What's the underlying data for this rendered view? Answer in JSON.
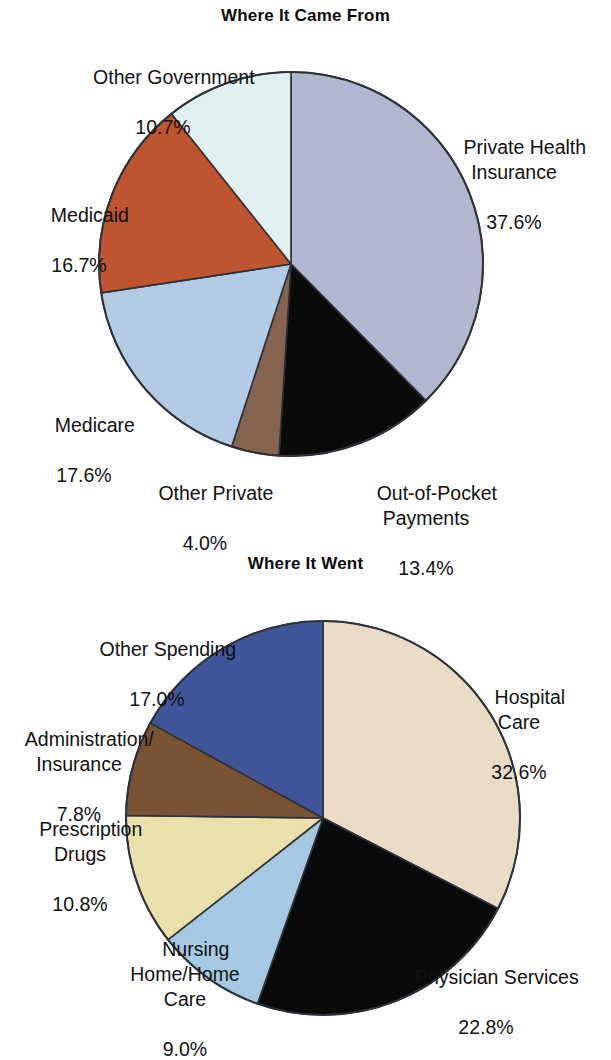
{
  "page": {
    "background": "#ffffff",
    "width": 611,
    "height": 1046
  },
  "charts": [
    {
      "id": "came-from",
      "title": "Where It Came From",
      "center": {
        "x": 291,
        "y": 264
      },
      "radius": 192,
      "start_angle_deg": 0,
      "direction": "clockwise"
    },
    {
      "id": "went",
      "title": "Where It Went",
      "center": {
        "x": 323,
        "y": 278
      },
      "radius": 197,
      "start_angle_deg": 0,
      "direction": "clockwise"
    }
  ],
  "labels": {
    "came_from": {
      "other_government": {
        "name": "Other Government",
        "pct": "10.7%"
      },
      "private_health": {
        "name": "Private Health\nInsurance",
        "pct": "37.6%"
      },
      "medicaid": {
        "name": "Medicaid",
        "pct": "16.7%"
      },
      "medicare": {
        "name": "Medicare",
        "pct": "17.6%"
      },
      "other_private": {
        "name": "Other Private",
        "pct": "4.0%"
      },
      "out_of_pocket": {
        "name": "Out-of-Pocket\nPayments",
        "pct": "13.4%"
      }
    },
    "went": {
      "other_spending": {
        "name": "Other Spending",
        "pct": "17.0%"
      },
      "administration": {
        "name": "Administration/\nInsurance",
        "pct": "7.8%"
      },
      "prescription": {
        "name": "Prescription\nDrugs",
        "pct": "10.8%"
      },
      "nursing_home": {
        "name": "Nursing\nHome/Home\nCare",
        "pct": "9.0%"
      },
      "hospital_care": {
        "name": "Hospital\nCare",
        "pct": "32.6%"
      },
      "physician": {
        "name": "Physician Services",
        "pct": "22.8%"
      }
    }
  },
  "chart_data": [
    {
      "type": "pie",
      "id": "came-from",
      "title": "Where It Came From",
      "xlabel": "",
      "ylabel": "",
      "legend_position": "none",
      "grid": false,
      "units": "percent",
      "total": 100.0,
      "start_angle_deg": 0,
      "direction": "clockwise",
      "categories": [
        "Private Health Insurance",
        "Out-of-Pocket Payments",
        "Other Private",
        "Medicare",
        "Medicaid",
        "Other Government"
      ],
      "values": [
        37.6,
        13.4,
        4.0,
        17.6,
        16.7,
        10.7
      ],
      "slices": [
        {
          "label": "Private Health Insurance",
          "value": 37.6,
          "color": "#b3b6cf",
          "stroke": "#2d3238"
        },
        {
          "label": "Out-of-Pocket Payments",
          "value": 13.4,
          "color": "#0a0a0a",
          "stroke": "#2d3238"
        },
        {
          "label": "Other Private",
          "value": 4.0,
          "color": "#87644f",
          "stroke": "#2d3238"
        },
        {
          "label": "Medicare",
          "value": 17.6,
          "color": "#b2cae4",
          "stroke": "#2d3238"
        },
        {
          "label": "Medicaid",
          "value": 16.7,
          "color": "#bf5430",
          "stroke": "#2d3238"
        },
        {
          "label": "Other Government",
          "value": 10.7,
          "color": "#e0f0f0",
          "stroke": "#2d3238"
        }
      ]
    },
    {
      "type": "pie",
      "id": "went",
      "title": "Where It Went",
      "xlabel": "",
      "ylabel": "",
      "legend_position": "none",
      "grid": false,
      "units": "percent",
      "total": 100.0,
      "start_angle_deg": 0,
      "direction": "clockwise",
      "categories": [
        "Hospital Care",
        "Physician Services",
        "Nursing Home/Home Care",
        "Prescription Drugs",
        "Administration/Insurance",
        "Other Spending"
      ],
      "values": [
        32.6,
        22.8,
        9.0,
        10.8,
        7.8,
        17.0
      ],
      "slices": [
        {
          "label": "Hospital Care",
          "value": 32.6,
          "color": "#e8dcc6",
          "stroke": "#2d3238"
        },
        {
          "label": "Physician Services",
          "value": 22.8,
          "color": "#0a0a0a",
          "stroke": "#2d3238"
        },
        {
          "label": "Nursing Home/Home Care",
          "value": 9.0,
          "color": "#a5c9e2",
          "stroke": "#2d3238"
        },
        {
          "label": "Prescription Drugs",
          "value": 10.8,
          "color": "#e9e0ab",
          "stroke": "#2d3238"
        },
        {
          "label": "Administration/Insurance",
          "value": 7.8,
          "color": "#7a5334",
          "stroke": "#2d3238"
        },
        {
          "label": "Other Spending",
          "value": 17.0,
          "color": "#41569a",
          "stroke": "#2d3238"
        }
      ]
    }
  ]
}
